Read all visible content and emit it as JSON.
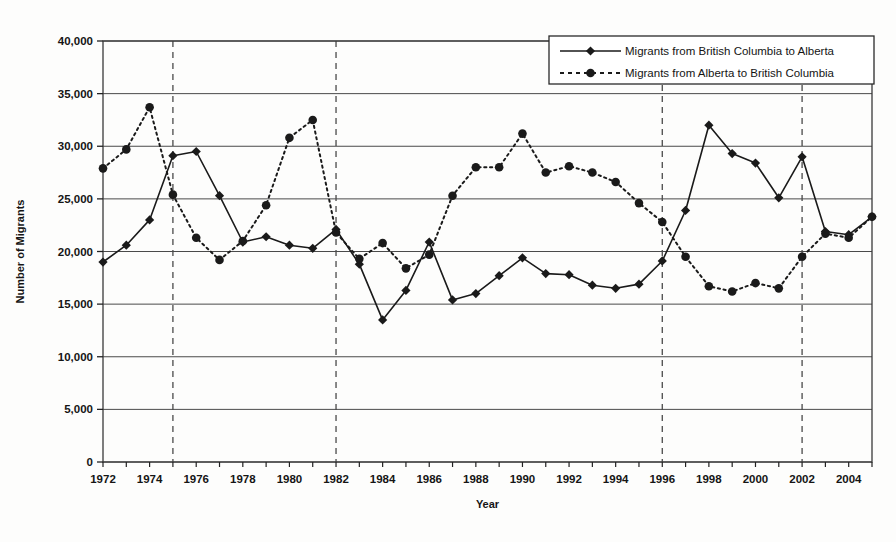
{
  "chart_data": {
    "type": "line",
    "title": "",
    "xlabel": "Year",
    "ylabel": "Number of Migrants",
    "xlim": [
      1972,
      2005
    ],
    "ylim": [
      0,
      40000
    ],
    "ytick_step": 5000,
    "xtick_step": 1,
    "xtick_label_step": 2,
    "grid": "horizontal",
    "legend_position": "top-right",
    "x": [
      1972,
      1973,
      1974,
      1975,
      1976,
      1977,
      1978,
      1979,
      1980,
      1981,
      1982,
      1983,
      1984,
      1985,
      1986,
      1987,
      1988,
      1989,
      1990,
      1991,
      1992,
      1993,
      1994,
      1995,
      1996,
      1997,
      1998,
      1999,
      2000,
      2001,
      2002,
      2003,
      2004,
      2005
    ],
    "xticklabels": [
      "1972",
      "1974",
      "1976",
      "1978",
      "1980",
      "1982",
      "1984",
      "1986",
      "1988",
      "1990",
      "1992",
      "1994",
      "1996",
      "1998",
      "2000",
      "2002",
      "2004"
    ],
    "yticklabels": [
      "0",
      "5,000",
      "10,000",
      "15,000",
      "20,000",
      "25,000",
      "30,000",
      "35,000",
      "40,000"
    ],
    "series": [
      {
        "name": "Migrants from British Columbia to Alberta",
        "style": "solid",
        "marker": "diamond",
        "color": "#1a1a1a",
        "values": [
          19000,
          20600,
          23000,
          29100,
          29500,
          25300,
          20900,
          21400,
          20600,
          20300,
          22100,
          18800,
          13500,
          16300,
          20900,
          15400,
          16000,
          17700,
          19400,
          17900,
          17800,
          16800,
          16500,
          16900,
          19100,
          23900,
          32000,
          29300,
          28400,
          25100,
          29000,
          21900,
          21600,
          23300
        ]
      },
      {
        "name": "Migrants from Alberta to British Columbia",
        "style": "dotted",
        "marker": "circle",
        "color": "#1a1a1a",
        "values": [
          27900,
          29700,
          33700,
          25400,
          21300,
          19200,
          21000,
          24400,
          30800,
          32500,
          21800,
          19300,
          20800,
          18400,
          19700,
          25300,
          28000,
          28000,
          31200,
          27500,
          28100,
          27500,
          26600,
          24600,
          22800,
          19500,
          16700,
          16200,
          17000,
          16500,
          19500,
          21700,
          21300,
          23300
        ]
      }
    ],
    "vertical_markers": [
      1975,
      1982,
      1996,
      2002
    ]
  },
  "legend": {
    "entries": [
      {
        "label": "Migrants from British Columbia to Alberta"
      },
      {
        "label": "Migrants from Alberta to British Columbia"
      }
    ]
  }
}
